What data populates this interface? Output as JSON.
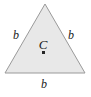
{
  "figure": {
    "name": "equilateral-triangle-with-center",
    "canvas": {
      "width": 91,
      "height": 97,
      "background_color": "#ffffff"
    },
    "shape": {
      "type": "triangle",
      "variant": "equilateral",
      "fill_color": "#e8e8e8",
      "stroke_color": "#9a9a9a",
      "stroke_width": 1,
      "vertices": [
        {
          "x": 45,
          "y": 4
        },
        {
          "x": 85,
          "y": 73
        },
        {
          "x": 5,
          "y": 73
        }
      ],
      "points_attr": "45,4 85,73 5,73"
    },
    "center": {
      "label": "C",
      "marker_shape": "square",
      "marker_color": "#262626",
      "marker_size": 3,
      "x": 44,
      "y": 53
    },
    "side_labels": {
      "left": "b",
      "right": "b",
      "bottom": "b"
    }
  }
}
